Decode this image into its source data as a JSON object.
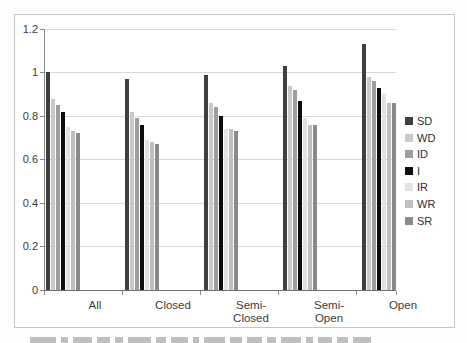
{
  "chart_data": {
    "type": "bar",
    "title": "",
    "xlabel": "",
    "ylabel": "",
    "categories": [
      "All",
      "Closed",
      "Semi-Closed",
      "Semi-Open",
      "Open"
    ],
    "category_label_lines": [
      [
        "All"
      ],
      [
        "Closed"
      ],
      [
        "Semi-",
        "Closed"
      ],
      [
        "Semi-",
        "Open"
      ],
      [
        "Open"
      ]
    ],
    "series": [
      {
        "name": "SD",
        "color": "#3f3f3f",
        "values": [
          1.0,
          0.97,
          0.99,
          1.03,
          1.13
        ]
      },
      {
        "name": "WD",
        "color": "#c9c9c9",
        "values": [
          0.88,
          0.82,
          0.86,
          0.94,
          0.98
        ]
      },
      {
        "name": "ID",
        "color": "#9e9e9e",
        "values": [
          0.85,
          0.79,
          0.84,
          0.92,
          0.96
        ]
      },
      {
        "name": "I",
        "color": "#0d0d0d",
        "values": [
          0.82,
          0.76,
          0.8,
          0.87,
          0.93
        ]
      },
      {
        "name": "IR",
        "color": "#e2e2e2",
        "values": [
          0.75,
          0.69,
          0.74,
          0.79,
          0.9
        ]
      },
      {
        "name": "WR",
        "color": "#bfbfbf",
        "values": [
          0.73,
          0.68,
          0.74,
          0.76,
          0.86
        ]
      },
      {
        "name": "SR",
        "color": "#8a8a8a",
        "values": [
          0.72,
          0.67,
          0.73,
          0.76,
          0.86
        ]
      }
    ],
    "ylim": [
      0,
      1.2
    ],
    "y_ticks": [
      "0",
      "0.2",
      "0.4",
      "0.6",
      "0.8",
      "1",
      "1.2"
    ],
    "y_tick_values": [
      0,
      0.2,
      0.4,
      0.6,
      0.8,
      1,
      1.2
    ],
    "grid": true,
    "legend_position": "right",
    "legend_entries": [
      "SD",
      "WD",
      "ID",
      "I",
      "IR",
      "WR",
      "SR"
    ]
  },
  "colors": {
    "gridline": "#d8d8d8",
    "axis": "#8a8a8a",
    "frame_border": "#c6c6c6",
    "label_text": "#3c3c3c",
    "background": "#ffffff"
  }
}
